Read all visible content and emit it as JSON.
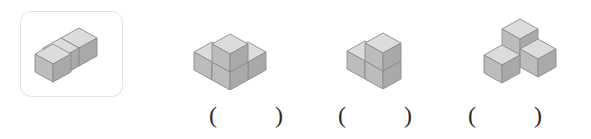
{
  "page": {
    "background_color": "#ffffff",
    "width": 591,
    "height": 139
  },
  "reference": {
    "box_name": "reference-figure-box",
    "box_border_color": "#e3e3e3",
    "figure_label": "L-shaped arrangement of three cubes lying flat",
    "cube_count": 3
  },
  "cube_style": {
    "top_face_color": "#d9d9d9",
    "left_face_color": "#b5b5b5",
    "right_face_color": "#a8a8a8",
    "outline_color": "#8c8c8c"
  },
  "options": [
    {
      "id": "option-1",
      "figure_label": "Three cubes in a row with one cube on top of the middle cube",
      "cube_count": 4,
      "answer_open_paren": "(",
      "answer_value": "",
      "answer_close_paren": ")"
    },
    {
      "id": "option-2",
      "figure_label": "Two cubes side by side with one cube on top of the right cube",
      "cube_count": 3,
      "answer_open_paren": "(",
      "answer_value": "",
      "answer_close_paren": ")"
    },
    {
      "id": "option-3",
      "figure_label": "Corner arrangement of three cubes, one behind and two in front",
      "cube_count": 3,
      "answer_open_paren": "(",
      "answer_value": "",
      "answer_close_paren": ")"
    }
  ]
}
